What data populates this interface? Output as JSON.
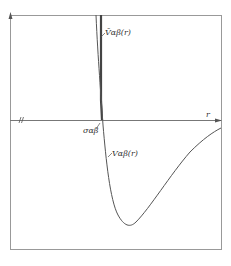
{
  "diagram": {
    "type": "potential-curve",
    "x_axis_label": "r",
    "axis_break_symbol": "//",
    "curves": [
      {
        "name": "effective-potential",
        "label": "V̄αβ(r)",
        "style": "thick"
      },
      {
        "name": "pair-potential",
        "label": "Vαβ(r)",
        "style": "thin"
      }
    ],
    "marker_label": "σαβ"
  },
  "labels": {
    "vbar": "V̄αβ(r)",
    "v": "Vαβ(r)",
    "sigma": "σαβ",
    "r": "r",
    "break": "//"
  },
  "colors": {
    "line": "#555555",
    "frame": "#888888",
    "background": "#ffffff"
  }
}
